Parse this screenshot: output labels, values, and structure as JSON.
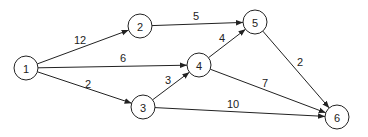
{
  "diagram": {
    "type": "directed-weighted-graph",
    "nodes": [
      {
        "id": "1",
        "label": "1",
        "x": 26,
        "y": 68
      },
      {
        "id": "2",
        "label": "2",
        "x": 140,
        "y": 26
      },
      {
        "id": "3",
        "label": "3",
        "x": 143,
        "y": 107
      },
      {
        "id": "4",
        "label": "4",
        "x": 199,
        "y": 65
      },
      {
        "id": "5",
        "label": "5",
        "x": 255,
        "y": 22
      },
      {
        "id": "6",
        "label": "6",
        "x": 337,
        "y": 117
      }
    ],
    "edges": [
      {
        "from": "1",
        "to": "2",
        "weight": "12",
        "lx": 80,
        "ly": 44
      },
      {
        "from": "1",
        "to": "4",
        "weight": "6",
        "lx": 123,
        "ly": 62
      },
      {
        "from": "1",
        "to": "3",
        "weight": "2",
        "lx": 88,
        "ly": 88
      },
      {
        "from": "2",
        "to": "5",
        "weight": "5",
        "lx": 196,
        "ly": 20
      },
      {
        "from": "3",
        "to": "4",
        "weight": "3",
        "lx": 168,
        "ly": 84
      },
      {
        "from": "4",
        "to": "5",
        "weight": "4",
        "lx": 222,
        "ly": 42
      },
      {
        "from": "4",
        "to": "6",
        "weight": "7",
        "lx": 265,
        "ly": 87
      },
      {
        "from": "3",
        "to": "6",
        "weight": "10",
        "lx": 233,
        "ly": 108
      },
      {
        "from": "5",
        "to": "6",
        "weight": "2",
        "lx": 300,
        "ly": 66
      }
    ]
  }
}
